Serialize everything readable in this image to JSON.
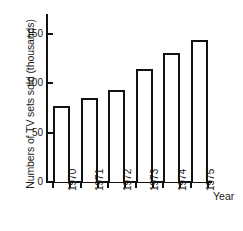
{
  "chart_data": {
    "type": "bar",
    "title": "",
    "categories": [
      "1970",
      "1971",
      "1972",
      "1973",
      "1974",
      "1975"
    ],
    "values": [
      77,
      85,
      93,
      114,
      131,
      144
    ],
    "series": [
      {
        "name": "Number of TV sets sold",
        "values": [
          77,
          85,
          93,
          114,
          131,
          144
        ]
      }
    ],
    "xlabel": "Year",
    "ylabel": "Numbers of TV sets sold (thousands)",
    "ylim": [
      0,
      170
    ],
    "yticks": [
      0,
      50,
      100,
      150
    ],
    "ytick_labels": [
      "0",
      "50",
      "100",
      "150"
    ],
    "xtick_labels": [
      "1970",
      "1971",
      "1972",
      "1973",
      "1974",
      "1975"
    ],
    "grid": false,
    "legend": false,
    "bar_fill": "#ffffff",
    "bar_edge_color": "#111111",
    "axis_color": "#111111"
  },
  "axis": {
    "y_title": "Numbers of TV sets sold (thousands)",
    "x_title": "Year",
    "y_ticks": [
      {
        "label": "150",
        "value": 150
      },
      {
        "label": "100",
        "value": 100
      },
      {
        "label": "50",
        "value": 50
      },
      {
        "label": "0",
        "value": 0
      }
    ]
  },
  "bars": [
    {
      "label": "1970",
      "value": 77
    },
    {
      "label": "1971",
      "value": 85
    },
    {
      "label": "1972",
      "value": 93
    },
    {
      "label": "1973",
      "value": 114
    },
    {
      "label": "1974",
      "value": 131
    },
    {
      "label": "1975",
      "value": 144
    }
  ]
}
